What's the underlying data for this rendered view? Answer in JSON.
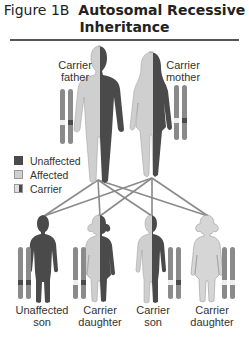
{
  "title": {
    "prefix": "Figure 1B",
    "main_line1": "Autosomal Recessive",
    "main_line2": "Inheritance"
  },
  "parents": [
    {
      "label_line1": "Carrier",
      "label_line2": "father"
    },
    {
      "label_line1": "Carrier",
      "label_line2": "mother"
    }
  ],
  "legend": {
    "items": [
      {
        "label": "Unaffected",
        "color": "#4a4a4a"
      },
      {
        "label": "Affected",
        "color": "#cfcfcf"
      },
      {
        "label": "Carrier",
        "color": "split"
      }
    ]
  },
  "children": [
    {
      "label_line1": "Unaffected",
      "label_line2": "son"
    },
    {
      "label_line1": "Carrier",
      "label_line2": "daughter"
    },
    {
      "label_line1": "Carrier",
      "label_line2": "son"
    },
    {
      "label_line1": "Carrier",
      "label_line2": "daughter"
    }
  ],
  "colors": {
    "dark": "#4a4a4a",
    "light": "#cfcfcf",
    "chromosome": "#8a8a8a",
    "line": "#8a8a8a"
  }
}
